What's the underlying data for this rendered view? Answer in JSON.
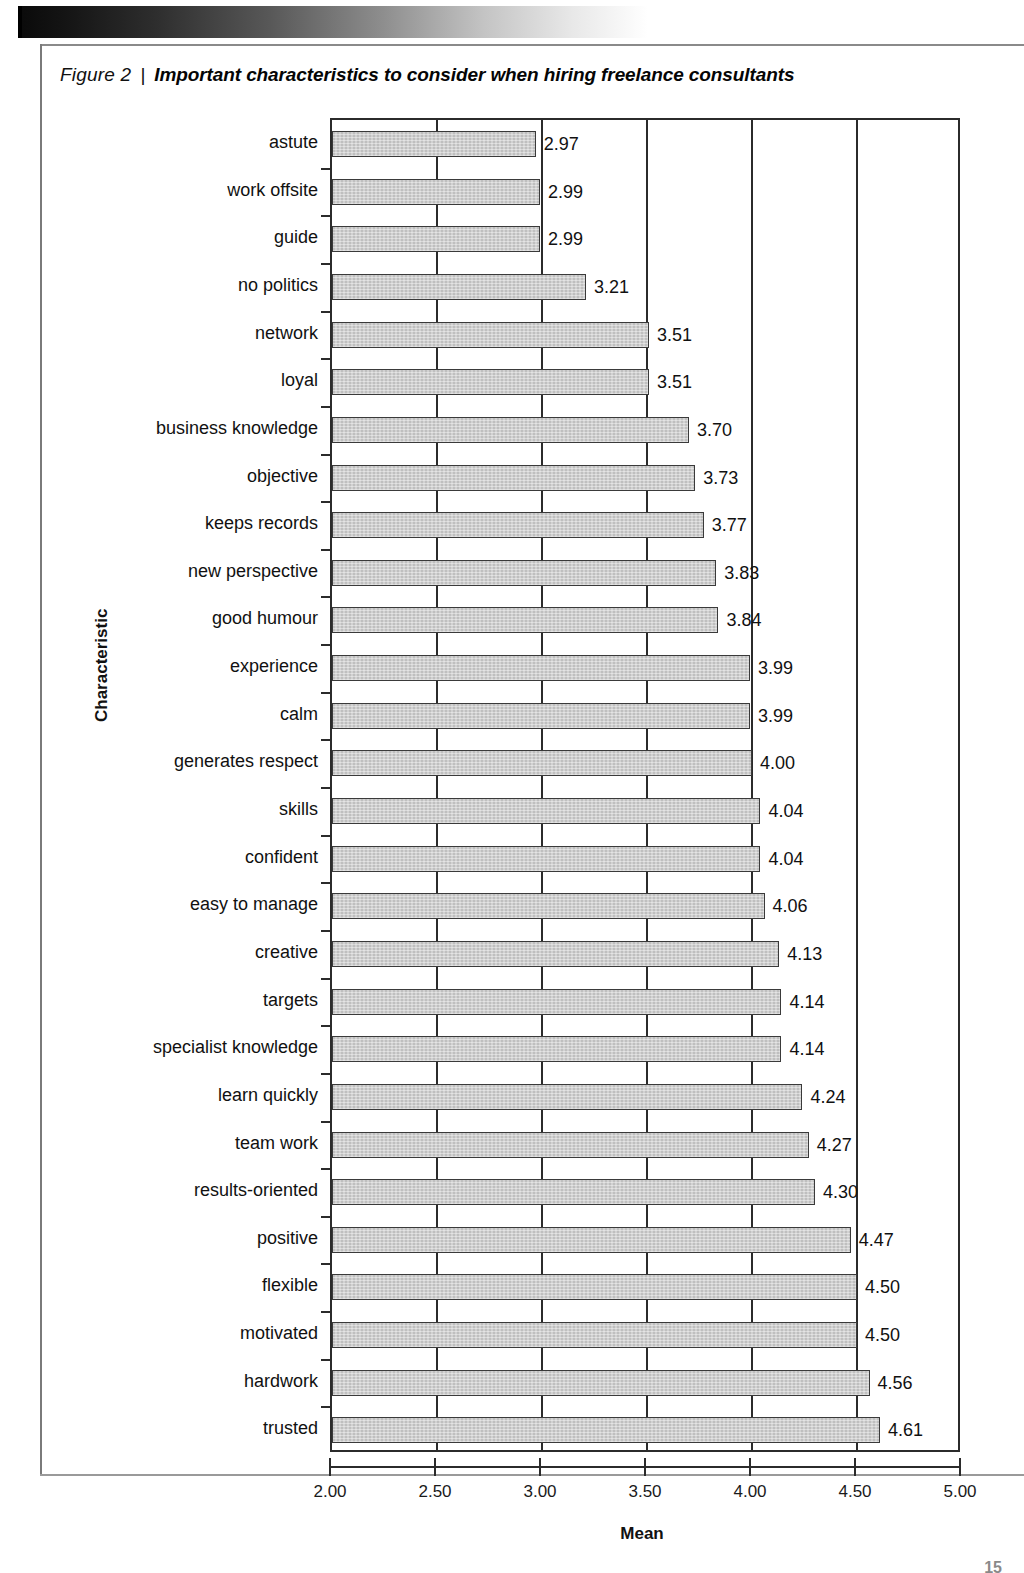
{
  "figure": {
    "number_label": "Figure 2",
    "separator": "|",
    "title": "Important characteristics to consider when hiring freelance consultants"
  },
  "page_number": "15",
  "colors": {
    "bar_fill": "#c9c9c9",
    "bar_border": "#3a3a3a",
    "axis": "#2b2b2b",
    "text": "#111111"
  },
  "chart_data": {
    "type": "bar",
    "orientation": "horizontal",
    "title": "Important characteristics to consider when hiring freelance consultants",
    "xlabel": "Mean",
    "ylabel": "Characteristic",
    "xlim": [
      2.0,
      5.0
    ],
    "xticks": [
      "2.00",
      "2.50",
      "3.00",
      "3.50",
      "4.00",
      "4.50",
      "5.00"
    ],
    "xtick_values": [
      2.0,
      2.5,
      3.0,
      3.5,
      4.0,
      4.5,
      5.0
    ],
    "grid": true,
    "grid_axis": "x",
    "legend": null,
    "data_labels": true,
    "categories": [
      "astute",
      "work offsite",
      "guide",
      "no politics",
      "network",
      "loyal",
      "business knowledge",
      "objective",
      "keeps records",
      "new perspective",
      "good humour",
      "experience",
      "calm",
      "generates respect",
      "skills",
      "confident",
      "easy to manage",
      "creative",
      "targets",
      "specialist knowledge",
      "learn quickly",
      "team work",
      "results-oriented",
      "positive",
      "flexible",
      "motivated",
      "hardwork",
      "trusted"
    ],
    "values": [
      2.97,
      2.99,
      2.99,
      3.21,
      3.51,
      3.51,
      3.7,
      3.73,
      3.77,
      3.83,
      3.84,
      3.99,
      3.99,
      4.0,
      4.04,
      4.04,
      4.06,
      4.13,
      4.14,
      4.14,
      4.24,
      4.27,
      4.3,
      4.47,
      4.5,
      4.5,
      4.56,
      4.61
    ],
    "value_labels": [
      "2.97",
      "2.99",
      "2.99",
      "3.21",
      "3.51",
      "3.51",
      "3.70",
      "3.73",
      "3.77",
      "3.83",
      "3.84",
      "3.99",
      "3.99",
      "4.00",
      "4.04",
      "4.04",
      "4.06",
      "4.13",
      "4.14",
      "4.14",
      "4.24",
      "4.27",
      "4.30",
      "4.47",
      "4.50",
      "4.50",
      "4.56",
      "4.61"
    ]
  }
}
